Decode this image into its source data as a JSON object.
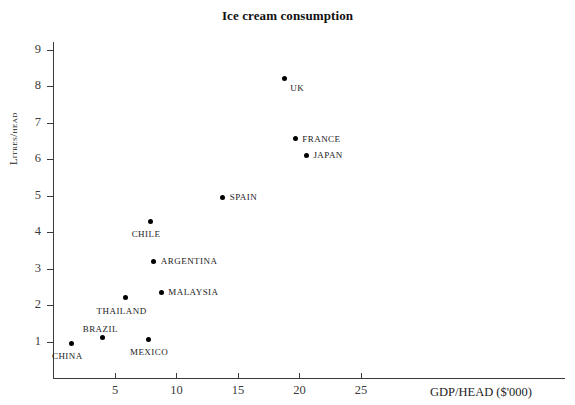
{
  "chart_data": {
    "type": "scatter",
    "title": "Ice cream consumption",
    "xlabel": "GDP/HEAD ($'000)",
    "ylabel": "Litres/head",
    "xlim": [
      0,
      29.5
    ],
    "ylim": [
      0,
      9.3
    ],
    "xticks": [
      5,
      10,
      15,
      20,
      25
    ],
    "yticks": [
      1,
      2,
      3,
      4,
      5,
      6,
      7,
      8,
      9
    ],
    "grid": false,
    "legend": "none",
    "points": [
      {
        "label": "CHINA",
        "x": 1.5,
        "y": 0.95,
        "label_pos": "below-left"
      },
      {
        "label": "BRAZIL",
        "x": 4.0,
        "y": 1.1,
        "label_pos": "above-left"
      },
      {
        "label": "MEXICO",
        "x": 7.8,
        "y": 1.05,
        "label_pos": "below"
      },
      {
        "label": "THAILAND",
        "x": 5.9,
        "y": 2.2,
        "label_pos": "below-left"
      },
      {
        "label": "MALAYSIA",
        "x": 8.8,
        "y": 2.35,
        "label_pos": "right"
      },
      {
        "label": "ARGENTINA",
        "x": 8.2,
        "y": 3.2,
        "label_pos": "right"
      },
      {
        "label": "CHILE",
        "x": 7.9,
        "y": 4.3,
        "label_pos": "below-left"
      },
      {
        "label": "SPAIN",
        "x": 13.8,
        "y": 4.95,
        "label_pos": "right"
      },
      {
        "label": "JAPAN",
        "x": 20.6,
        "y": 6.1,
        "label_pos": "right"
      },
      {
        "label": "FRANCE",
        "x": 19.7,
        "y": 6.55,
        "label_pos": "right"
      },
      {
        "label": "UK",
        "x": 18.8,
        "y": 8.2,
        "label_pos": "below-right"
      }
    ]
  },
  "colors": {
    "point": "#000000",
    "axis": "#3a3a3a",
    "text": "#111111",
    "background": "#ffffff"
  }
}
